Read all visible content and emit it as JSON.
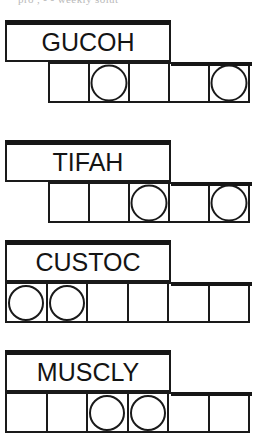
{
  "page": {
    "clipped_top_text": "pro      ,          - -  weekly solut"
  },
  "colors": {
    "ink": "#1a1a1a",
    "paper": "#ffffff",
    "rule": "#161616"
  },
  "puzzle": {
    "rows": [
      {
        "word": "GUCOH",
        "cell_count": 5,
        "grid_offset": "indent",
        "circled_cells": [
          2,
          5
        ],
        "cells": [
          "",
          "",
          "",
          "",
          ""
        ]
      },
      {
        "word": "TIFAH",
        "cell_count": 5,
        "grid_offset": "indent",
        "circled_cells": [
          3,
          5
        ],
        "cells": [
          "",
          "",
          "",
          "",
          ""
        ]
      },
      {
        "word": "CUSTOC",
        "cell_count": 6,
        "grid_offset": "full",
        "circled_cells": [
          1,
          2
        ],
        "cells": [
          "",
          "",
          "",
          "",
          "",
          ""
        ]
      },
      {
        "word": "MUSCLY",
        "cell_count": 6,
        "grid_offset": "full",
        "circled_cells": [
          3,
          4
        ],
        "cells": [
          "",
          "",
          "",
          "",
          "",
          ""
        ]
      }
    ]
  }
}
